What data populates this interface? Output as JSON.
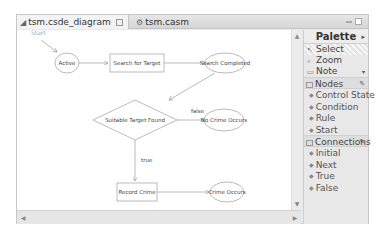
{
  "editor": {
    "tabs": [
      {
        "label": "tsm.csde_diagram",
        "icon": "diagram-icon",
        "active": true
      },
      {
        "label": "tsm.casm",
        "icon": "model-icon",
        "active": false
      }
    ]
  },
  "diagram": {
    "start_label": "Start",
    "nodes": [
      {
        "id": "active",
        "label": "Active",
        "shape": "ellipse"
      },
      {
        "id": "search",
        "label": "Search for Target",
        "shape": "rect"
      },
      {
        "id": "completed",
        "label": "Search Completed",
        "shape": "ellipse"
      },
      {
        "id": "suitable",
        "label": "Suitable Target Found",
        "shape": "diamond"
      },
      {
        "id": "nocrime",
        "label": "No Crime Occurs",
        "shape": "ellipse"
      },
      {
        "id": "record",
        "label": "Record Crime",
        "shape": "rect"
      },
      {
        "id": "crime",
        "label": "Crime Occurs",
        "shape": "ellipse"
      }
    ],
    "edge_labels": {
      "false": "false",
      "true": "true"
    }
  },
  "palette": {
    "title": "Palette",
    "tools": [
      {
        "label": "Select",
        "icon": "select-arrow-icon",
        "selected": true
      },
      {
        "label": "Zoom",
        "icon": "zoom-icon",
        "selected": false
      },
      {
        "label": "Note",
        "icon": "note-icon",
        "selected": false
      }
    ],
    "drawers": [
      {
        "label": "Nodes",
        "items": [
          "Control State",
          "Condition",
          "Rule",
          "Start"
        ]
      },
      {
        "label": "Connections",
        "items": [
          "Initial",
          "Next",
          "True",
          "False"
        ]
      }
    ]
  }
}
